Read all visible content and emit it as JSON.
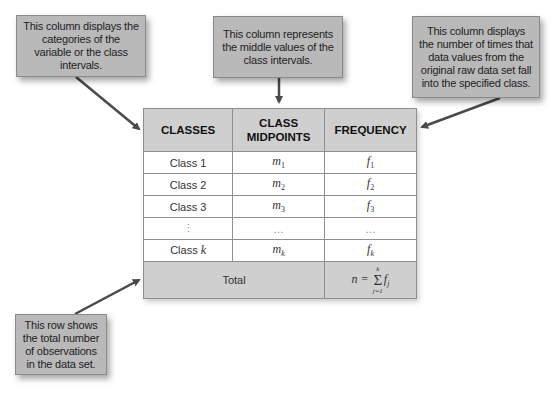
{
  "callouts": {
    "classes": "This column displays the categories of the variable or the class intervals.",
    "midpoints": "This column represents the middle values of the class intervals.",
    "frequency": "This column displays the number of times that data values from the original raw data set fall into the specified class.",
    "total": "This row shows the total number of observations in the data set."
  },
  "table": {
    "headers": [
      "CLASSES",
      "CLASS MIDPOINTS",
      "FREQUENCY"
    ],
    "rows": [
      {
        "class": "Class 1",
        "midpoint": "m",
        "midpoint_sub": "1",
        "frequency": "f",
        "frequency_sub": "1"
      },
      {
        "class": "Class 2",
        "midpoint": "m",
        "midpoint_sub": "2",
        "frequency": "f",
        "frequency_sub": "2"
      },
      {
        "class": "Class 3",
        "midpoint": "m",
        "midpoint_sub": "3",
        "frequency": "f",
        "frequency_sub": "3"
      },
      {
        "class": "⋮",
        "midpoint": "…",
        "midpoint_sub": "",
        "frequency": "…",
        "frequency_sub": ""
      },
      {
        "class_prefix": "Class ",
        "class_var": "k",
        "midpoint": "m",
        "midpoint_sub": "k",
        "frequency": "f",
        "frequency_sub": "k"
      }
    ],
    "total": {
      "label": "Total",
      "formula_lhs": "n =",
      "sum_upper": "k",
      "sum_symbol": "Σ",
      "sum_lower": "j=1",
      "formula_term": "f",
      "formula_term_sub": "j"
    }
  },
  "colors": {
    "callout_fill": "#b9b9b9",
    "header_fill": "#cfcfcf",
    "arrow": "#4a4a4a",
    "border": "#8f8f8f"
  }
}
